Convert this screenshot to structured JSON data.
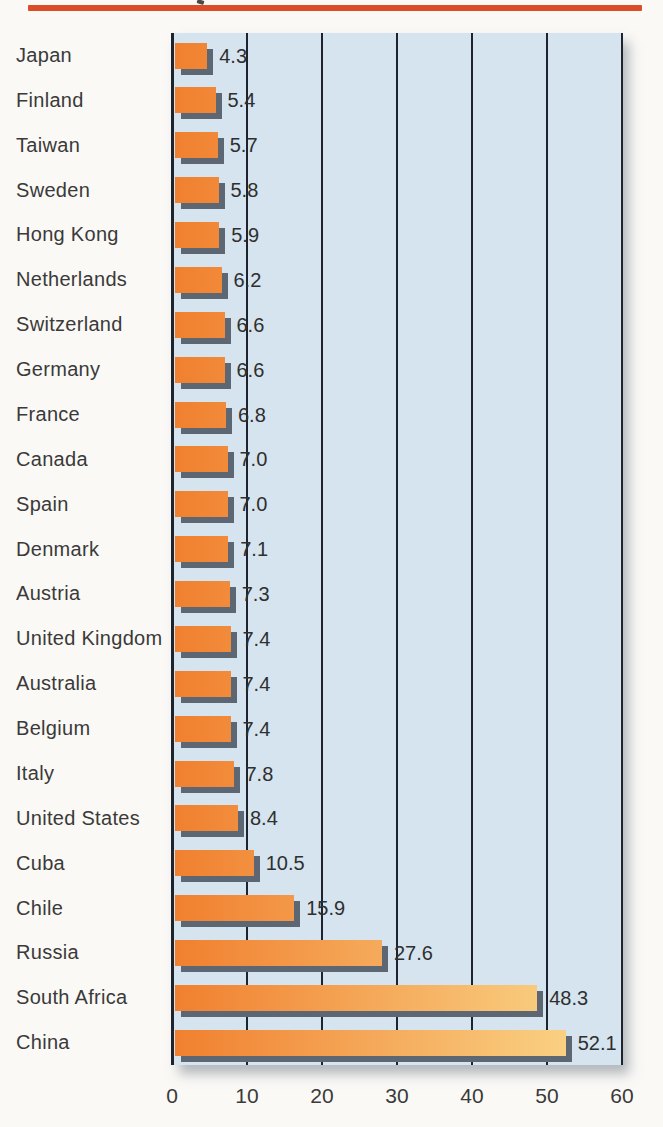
{
  "page": {
    "top_rule_color": "#dd4c29",
    "background_color": "#faf9f6"
  },
  "chart_data": {
    "type": "bar",
    "orientation": "horizontal",
    "title": "",
    "xlabel": "",
    "ylabel": "",
    "xlim": [
      0,
      60
    ],
    "xticks": [
      0,
      10,
      20,
      30,
      40,
      50,
      60
    ],
    "grid": "vertical",
    "legend": "none",
    "categories": [
      "Japan",
      "Finland",
      "Taiwan",
      "Sweden",
      "Hong Kong",
      "Netherlands",
      "Switzerland",
      "Germany",
      "France",
      "Canada",
      "Spain",
      "Denmark",
      "Austria",
      "United Kingdom",
      "Australia",
      "Belgium",
      "Italy",
      "United States",
      "Cuba",
      "Chile",
      "Russia",
      "South Africa",
      "China"
    ],
    "values": [
      4.3,
      5.4,
      5.7,
      5.8,
      5.9,
      6.2,
      6.6,
      6.6,
      6.8,
      7.0,
      7.0,
      7.1,
      7.3,
      7.4,
      7.4,
      7.4,
      7.8,
      8.4,
      10.5,
      15.9,
      27.6,
      48.3,
      52.1
    ],
    "value_labels": [
      "4.3",
      "5.4",
      "5.7",
      "5.8",
      "5.9",
      "6.2",
      "6.6",
      "6.6",
      "6.8",
      "7.0",
      "7.0",
      "7.1",
      "7.3",
      "7.4",
      "7.4",
      "7.4",
      "7.8",
      "8.4",
      "10.5",
      "15.9",
      "27.6",
      "48.3",
      "52.1"
    ],
    "colors": {
      "plot_background": "#d5e4ee",
      "bar_gradient_start": "#f0802f",
      "bar_gradient_end": "#fbdc8f",
      "bar_shadow": "#5d6773",
      "gridline": "#1e242e",
      "tick_label": "#3a3a3a"
    }
  }
}
